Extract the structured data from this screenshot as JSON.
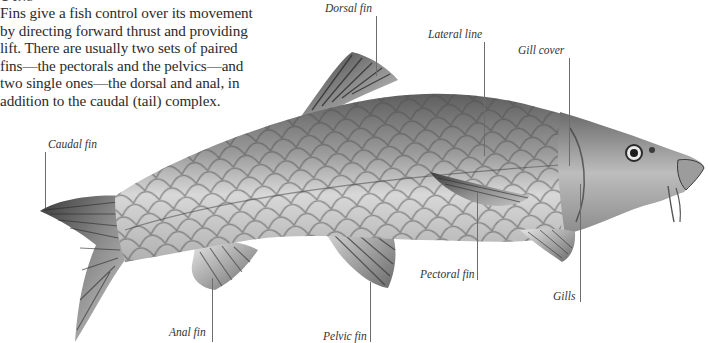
{
  "heading": "Fins",
  "intro": {
    "lines": [
      "Fins give a fish control over its movement",
      "by directing forward thrust and providing",
      "lift. There are usually two sets of paired",
      "fins—the pectorals and the pelvics—and",
      "two single ones—the dorsal and anal, in",
      "addition to the caudal (tail) complex."
    ]
  },
  "illustration": {
    "subject": "fish-carp-illustration",
    "labels": {
      "dorsal_fin": "Dorsal fin",
      "lateral_line": "Lateral line",
      "gill_cover": "Gill cover",
      "caudal_fin": "Caudal fin",
      "pectoral_fin": "Pectoral fin",
      "gills": "Gills",
      "anal_fin": "Anal fin",
      "pelvic_fin": "Pelvic fin"
    }
  },
  "colors": {
    "text": "#2b2b2b",
    "leader": "#6d6d6d",
    "background": "#ffffff"
  }
}
